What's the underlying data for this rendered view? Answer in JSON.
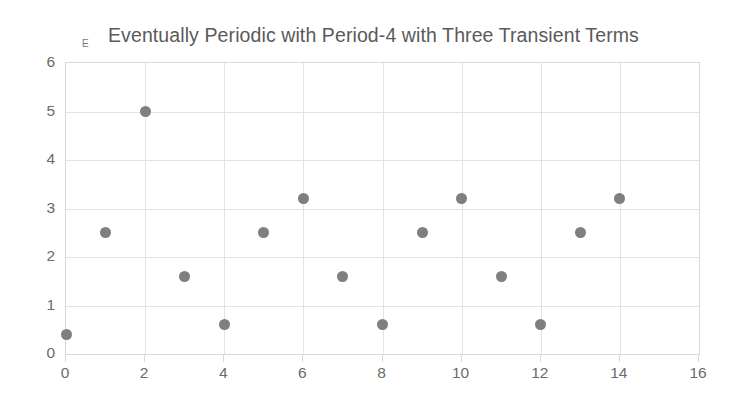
{
  "chart_data": {
    "type": "scatter",
    "title": "Eventually Periodic with Period-4 with Three Transient Terms",
    "series_marker_label": "E",
    "xlabel": "",
    "ylabel": "",
    "xlim": [
      0,
      16
    ],
    "ylim": [
      0,
      6
    ],
    "xticks": [
      0,
      2,
      4,
      6,
      8,
      10,
      12,
      14,
      16
    ],
    "yticks": [
      0,
      1,
      2,
      3,
      4,
      5,
      6
    ],
    "xtick_labels": [
      "0",
      "2",
      "4",
      "6",
      "8",
      "10",
      "12",
      "14",
      "16"
    ],
    "ytick_labels": [
      "0",
      "1",
      "2",
      "3",
      "4",
      "5",
      "6"
    ],
    "grid": true,
    "legend": false,
    "marker_color": "#7f7f7f",
    "gridline_color": "#e2e2e2",
    "x": [
      0,
      1,
      2,
      3,
      4,
      5,
      6,
      7,
      8,
      9,
      10,
      11,
      12,
      13,
      14
    ],
    "values": [
      0.4,
      2.5,
      5.0,
      1.6,
      0.6,
      2.5,
      3.2,
      1.6,
      0.6,
      2.5,
      3.2,
      1.6,
      0.6,
      2.5,
      3.2
    ],
    "points": [
      {
        "x": 0,
        "y": 0.4
      },
      {
        "x": 1,
        "y": 2.5
      },
      {
        "x": 2,
        "y": 5.0
      },
      {
        "x": 3,
        "y": 1.6
      },
      {
        "x": 4,
        "y": 0.6
      },
      {
        "x": 5,
        "y": 2.5
      },
      {
        "x": 6,
        "y": 3.2
      },
      {
        "x": 7,
        "y": 1.6
      },
      {
        "x": 8,
        "y": 0.6
      },
      {
        "x": 9,
        "y": 2.5
      },
      {
        "x": 10,
        "y": 3.2
      },
      {
        "x": 11,
        "y": 1.6
      },
      {
        "x": 12,
        "y": 0.6
      },
      {
        "x": 13,
        "y": 2.5
      },
      {
        "x": 14,
        "y": 3.2
      }
    ]
  }
}
